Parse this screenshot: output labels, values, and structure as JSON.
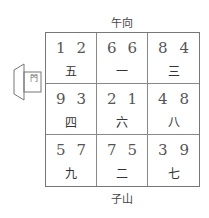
{
  "facing_label": "午向",
  "sitting_label": "子山",
  "door_label": "門",
  "cells": [
    {
      "mountain": "1",
      "water": "2",
      "period": "五"
    },
    {
      "mountain": "6",
      "water": "6",
      "period": "一"
    },
    {
      "mountain": "8",
      "water": "4",
      "period": "三"
    },
    {
      "mountain": "9",
      "water": "3",
      "period": "四"
    },
    {
      "mountain": "2",
      "water": "1",
      "period": "六"
    },
    {
      "mountain": "4",
      "water": "8",
      "period": "八"
    },
    {
      "mountain": "5",
      "water": "7",
      "period": "九"
    },
    {
      "mountain": "7",
      "water": "5",
      "period": "二"
    },
    {
      "mountain": "3",
      "water": "9",
      "period": "七"
    }
  ]
}
